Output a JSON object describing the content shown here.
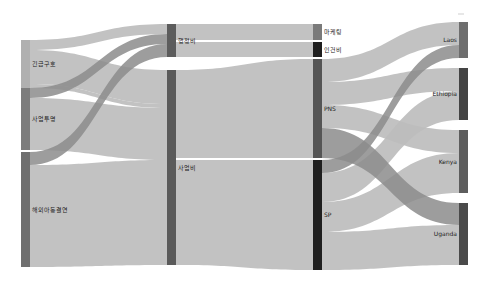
{
  "chart_data": {
    "type": "sankey",
    "title": "",
    "columns": [
      {
        "x": 21,
        "nodes": [
          {
            "id": "emergency",
            "label": "긴급구호",
            "y0": 40,
            "y1": 88,
            "color": "#b0b0b0",
            "label_side": "right"
          },
          {
            "id": "biz",
            "label": "사업투명",
            "y0": 88,
            "y1": 150,
            "color": "#7d7d7d",
            "label_side": "right"
          },
          {
            "id": "sponsor",
            "label": "해외아동결연",
            "y0": 152,
            "y1": 267,
            "color": "#6f6f6f",
            "label_side": "right"
          }
        ]
      },
      {
        "x": 167,
        "nodes": [
          {
            "id": "admin",
            "label": "행정비",
            "y0": 24,
            "y1": 57,
            "color": "#5c5c5c",
            "label_side": "right"
          },
          {
            "id": "project",
            "label": "사업비",
            "y0": 70,
            "y1": 265,
            "color": "#5a5a5a",
            "label_side": "right"
          }
        ]
      },
      {
        "x": 313,
        "nodes": [
          {
            "id": "marketing",
            "label": "마케팅",
            "y0": 24,
            "y1": 40,
            "color": "#7a7a7a",
            "label_side": "right"
          },
          {
            "id": "labor",
            "label": "인건비",
            "y0": 42,
            "y1": 57,
            "color": "#1e1e1e",
            "label_side": "right"
          },
          {
            "id": "pns",
            "label": "PNS",
            "y0": 59,
            "y1": 158,
            "color": "#555555",
            "label_side": "right"
          },
          {
            "id": "sp",
            "label": "SP",
            "y0": 160,
            "y1": 270,
            "color": "#1f1f1f",
            "label_side": "right"
          }
        ]
      },
      {
        "x": 459,
        "nodes": [
          {
            "id": "laos",
            "label": "Laos",
            "y0": 22,
            "y1": 58,
            "color": "#6e6e6e",
            "label_side": "left"
          },
          {
            "id": "ethiopia",
            "label": "Ethiopia",
            "y0": 68,
            "y1": 120,
            "color": "#444444",
            "label_side": "left"
          },
          {
            "id": "kenya",
            "label": "Kenya",
            "y0": 130,
            "y1": 193,
            "color": "#5d5d5d",
            "label_side": "left"
          },
          {
            "id": "uganda",
            "label": "Uganda",
            "y0": 203,
            "y1": 265,
            "color": "#4a4a4a",
            "label_side": "left"
          }
        ]
      }
    ],
    "node_width": 9,
    "links": [
      {
        "source": "emergency",
        "target": "admin",
        "sy0": 40,
        "sy1": 50,
        "ty0": 24,
        "ty1": 34,
        "dark": false
      },
      {
        "source": "emergency",
        "target": "project",
        "sy0": 50,
        "sy1": 84,
        "ty0": 70,
        "ty1": 104,
        "dark": false
      },
      {
        "source": "emergency",
        "target": "project",
        "sy0": 84,
        "sy1": 88,
        "ty0": 104,
        "ty1": 108,
        "dark": false
      },
      {
        "source": "biz",
        "target": "admin",
        "sy0": 88,
        "sy1": 98,
        "ty0": 34,
        "ty1": 44,
        "dark": true
      },
      {
        "source": "biz",
        "target": "project",
        "sy0": 98,
        "sy1": 150,
        "ty0": 108,
        "ty1": 160,
        "dark": false
      },
      {
        "source": "sponsor",
        "target": "admin",
        "sy0": 152,
        "sy1": 165,
        "ty0": 44,
        "ty1": 57,
        "dark": true
      },
      {
        "source": "sponsor",
        "target": "project",
        "sy0": 165,
        "sy1": 267,
        "ty0": 160,
        "ty1": 265,
        "dark": false
      },
      {
        "source": "admin",
        "target": "marketing",
        "sy0": 24,
        "sy1": 40,
        "ty0": 24,
        "ty1": 40,
        "dark": false
      },
      {
        "source": "admin",
        "target": "labor",
        "sy0": 42,
        "sy1": 57,
        "ty0": 42,
        "ty1": 57,
        "dark": false
      },
      {
        "source": "project",
        "target": "pns",
        "sy0": 70,
        "sy1": 158,
        "ty0": 59,
        "ty1": 158,
        "dark": false
      },
      {
        "source": "project",
        "target": "sp",
        "sy0": 160,
        "sy1": 265,
        "ty0": 160,
        "ty1": 270,
        "dark": false
      },
      {
        "source": "pns",
        "target": "laos",
        "sy0": 59,
        "sy1": 82,
        "ty0": 22,
        "ty1": 45,
        "dark": false
      },
      {
        "source": "pns",
        "target": "ethiopia",
        "sy0": 82,
        "sy1": 105,
        "ty0": 68,
        "ty1": 91,
        "dark": false
      },
      {
        "source": "pns",
        "target": "kenya",
        "sy0": 105,
        "sy1": 128,
        "ty0": 130,
        "ty1": 153,
        "dark": false
      },
      {
        "source": "pns",
        "target": "uganda",
        "sy0": 128,
        "sy1": 158,
        "ty0": 203,
        "ty1": 225,
        "dark": true
      },
      {
        "source": "sp",
        "target": "laos",
        "sy0": 160,
        "sy1": 173,
        "ty0": 45,
        "ty1": 58,
        "dark": true
      },
      {
        "source": "sp",
        "target": "ethiopia",
        "sy0": 173,
        "sy1": 202,
        "ty0": 91,
        "ty1": 120,
        "dark": false
      },
      {
        "source": "sp",
        "target": "kenya",
        "sy0": 202,
        "sy1": 232,
        "ty0": 153,
        "ty1": 193,
        "dark": false
      },
      {
        "source": "sp",
        "target": "uganda",
        "sy0": 232,
        "sy1": 270,
        "ty0": 225,
        "ty1": 265,
        "dark": false
      }
    ]
  }
}
